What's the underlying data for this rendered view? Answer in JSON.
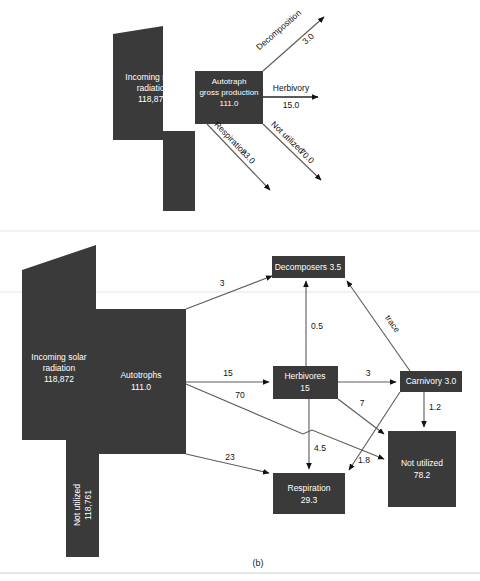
{
  "figure": {
    "caption": "(b)",
    "panel_a": {
      "nodes": [
        {
          "id": "solar",
          "lines": [
            "Incoming solar",
            "radiation",
            "118,872"
          ]
        },
        {
          "id": "autotroph",
          "lines": [
            "Autotraph",
            "gross production",
            "111.0"
          ]
        }
      ],
      "flows": [
        {
          "id": "decomposition",
          "label": "Decomposition",
          "value": "3.0",
          "direction": "up-right"
        },
        {
          "id": "herbivory",
          "label": "Herbivory",
          "value": "15.0",
          "direction": "right"
        },
        {
          "id": "not-utilized",
          "label": "Not utilized",
          "value": "70.0",
          "direction": "down-right"
        },
        {
          "id": "respiration",
          "label": "Respiration",
          "value": "23.0",
          "direction": "down-left-right"
        }
      ]
    },
    "panel_b": {
      "nodes": [
        {
          "id": "solar",
          "lines": [
            "Incoming solar",
            "radiation",
            "118,872"
          ]
        },
        {
          "id": "not-utilized-solar",
          "lines": [
            "Not utilized",
            "118,761"
          ]
        },
        {
          "id": "autotrophs",
          "lines": [
            "Autotrophs",
            "111.0"
          ]
        },
        {
          "id": "decomposers",
          "lines": [
            "Decomposers 3.5"
          ]
        },
        {
          "id": "herbivores",
          "lines": [
            "Herbivores",
            "15"
          ]
        },
        {
          "id": "carnivory",
          "lines": [
            "Carnivory 3.0"
          ]
        },
        {
          "id": "respiration",
          "lines": [
            "Respiration",
            "29.3"
          ]
        },
        {
          "id": "not-utilized",
          "lines": [
            "Not utilized",
            "78.2"
          ]
        }
      ],
      "flows": [
        {
          "id": "autotrophs-to-decomposers",
          "label": "3",
          "from": "autotrophs",
          "to": "decomposers"
        },
        {
          "id": "herbivores-to-decomposers",
          "label": "0.5",
          "from": "herbivores",
          "to": "decomposers"
        },
        {
          "id": "carnivory-to-decomposers",
          "label": "trace",
          "from": "carnivory",
          "to": "decomposers"
        },
        {
          "id": "autotrophs-to-herbivores",
          "label": "15",
          "from": "autotrophs",
          "to": "herbivores"
        },
        {
          "id": "autotrophs-to-notutilized",
          "label": "70",
          "from": "autotrophs",
          "to": "not-utilized"
        },
        {
          "id": "autotrophs-to-respiration",
          "label": "23",
          "from": "autotrophs",
          "to": "respiration"
        },
        {
          "id": "herbivores-to-carnivory",
          "label": "3",
          "from": "herbivores",
          "to": "carnivory"
        },
        {
          "id": "herbivores-to-notutilized",
          "label": "7",
          "from": "herbivores",
          "to": "not-utilized"
        },
        {
          "id": "herbivores-to-respiration",
          "label": "4.5",
          "from": "herbivores",
          "to": "respiration"
        },
        {
          "id": "carnivory-to-respiration",
          "label": "1.8",
          "from": "carnivory",
          "to": "respiration"
        },
        {
          "id": "carnivory-to-notutilized",
          "label": "1.2",
          "from": "carnivory",
          "to": "not-utilized"
        }
      ]
    }
  },
  "colors": {
    "shape": "#3a3a3a",
    "line": "#5a5a5a",
    "label_on_shape": "#ffffff",
    "label_on_page": "#111111"
  }
}
